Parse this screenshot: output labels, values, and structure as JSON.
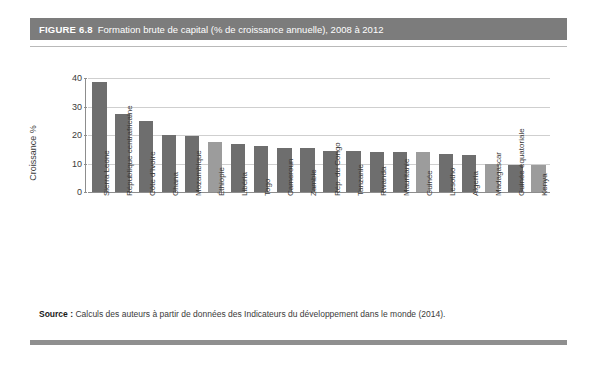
{
  "figure": {
    "number": "FIGURE 6.8",
    "title": "Formation brute de capital (% de croissance annuelle), 2008 à 2012",
    "source_label": "Source :",
    "source_text": "Calculs des auteurs à partir de données des Indicateurs du développement dans le monde (2014).",
    "band_color": "#7c7c7c"
  },
  "chart_data": {
    "type": "bar",
    "title": "Formation brute de capital (% de croissance annuelle), 2008 à 2012",
    "xlabel": "",
    "ylabel": "Croissance %",
    "ylim": [
      0,
      40
    ],
    "yticks": [
      0,
      10,
      20,
      30,
      40
    ],
    "ytick_labels": [
      "0",
      "10",
      "20",
      "30",
      "40"
    ],
    "grid": true,
    "legend": "none",
    "orientation": "vertical",
    "bar_color_dark": "#6e6e6e",
    "bar_color_light": "#9c9c9c",
    "categories": [
      "Sierra Leone",
      "République centrafricaine",
      "Côte d'Ivoire",
      "Ghana",
      "Mozambique",
      "Éthiopie",
      "Libéria",
      "Togo",
      "Cameroun",
      "Zambie",
      "Rép. du Congo",
      "Tanzanie",
      "Rwanda",
      "Mauritanie",
      "Guinée",
      "Lesotho",
      "Algeria",
      "Madagascar",
      "Guinée équatoriale",
      "Kenya"
    ],
    "values": [
      38.5,
      27.5,
      25.0,
      20.0,
      19.5,
      17.5,
      17.0,
      16.0,
      15.5,
      15.5,
      14.5,
      14.5,
      14.0,
      14.0,
      14.0,
      13.5,
      13.0,
      10.0,
      9.5,
      9.5
    ],
    "shades": [
      "dark",
      "dark",
      "dark",
      "dark",
      "dark",
      "light",
      "dark",
      "dark",
      "dark",
      "dark",
      "dark",
      "dark",
      "dark",
      "dark",
      "light",
      "dark",
      "dark",
      "light",
      "dark",
      "light"
    ]
  }
}
